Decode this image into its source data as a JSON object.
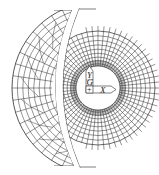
{
  "figure": {
    "type": "finite-element mesh diagram",
    "background": "#ffffff",
    "line_color": "#2a2a2a",
    "center": [
      98,
      88
    ],
    "hole_radius": 22,
    "inner_mesh": {
      "outer_radius": 57,
      "radial_lines": 64,
      "ring_count": 9,
      "left_cut_x": 76
    },
    "outer_crescent": {
      "outer_radius": 86,
      "inner_radius": 60,
      "top_y": 10,
      "bottom_y": 166,
      "radial_lines": 22,
      "ring_count": 5
    }
  },
  "axes": {
    "y_label": "Y",
    "g_label": "G",
    "origin_label": "+",
    "x_label": "X"
  }
}
